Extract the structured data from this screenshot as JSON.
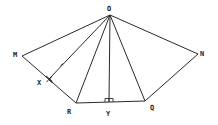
{
  "diagram": {
    "type": "geometry",
    "colors": {
      "stroke": "#2a2a2a",
      "label": "#222222",
      "background": "#ffffff"
    },
    "points": {
      "O": {
        "label": "O",
        "x": 110,
        "y": 15,
        "lx": 107,
        "ly": 11
      },
      "M": {
        "label": "M",
        "x": 22,
        "y": 56,
        "lx": 13,
        "ly": 57
      },
      "N": {
        "label": "N",
        "x": 198,
        "y": 54,
        "lx": 200,
        "ly": 55
      },
      "R": {
        "label": "R",
        "x": 76,
        "y": 103,
        "lx": 67,
        "ly": 114
      },
      "Y": {
        "label": "Y",
        "x": 109,
        "y": 102,
        "lx": 106,
        "ly": 116
      },
      "Q": {
        "label": "Q",
        "x": 145,
        "y": 101,
        "lx": 150,
        "ly": 109
      },
      "X": {
        "label": "X",
        "x": 49,
        "y": 79,
        "lx": 37,
        "ly": 85
      }
    },
    "segments": [
      [
        "O",
        "M"
      ],
      [
        "O",
        "X"
      ],
      [
        "O",
        "R"
      ],
      [
        "O",
        "Y"
      ],
      [
        "O",
        "Q"
      ],
      [
        "O",
        "N"
      ],
      [
        "M",
        "R"
      ],
      [
        "R",
        "Q"
      ],
      [
        "Q",
        "N"
      ]
    ],
    "right_angles": [
      "X",
      "Y"
    ],
    "tick_marks": [
      {
        "segment": [
          "O",
          "X"
        ],
        "count": 1
      }
    ]
  }
}
